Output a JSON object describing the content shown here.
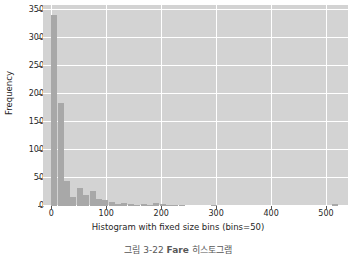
{
  "chart_data": {
    "type": "bar",
    "title": "",
    "subtitle": "",
    "xlabel": "Histogram with fixed size bins (bins=50)",
    "ylabel": "Frequency",
    "xlim": [
      -15,
      540
    ],
    "ylim": [
      0,
      358
    ],
    "grid": true,
    "legend": null,
    "bin_width": 11.6,
    "bins": 50,
    "xticks": [
      0,
      100,
      200,
      300,
      400,
      500
    ],
    "yticks": [
      0,
      50,
      100,
      150,
      200,
      250,
      300,
      350
    ],
    "bar_color": "#a8a8a8",
    "plot_background": "#d3d3d3",
    "grid_color": "#ffffff",
    "text_color": "#262626",
    "bin_edges": [
      0,
      11.6,
      23.2,
      34.8,
      46.4,
      58,
      69.6,
      81.2,
      92.8,
      104.4,
      116,
      127.6,
      139.2,
      150.8,
      162.4,
      174,
      185.6,
      197.2,
      208.8,
      220.4,
      232,
      243.6,
      255.2,
      266.8,
      278.4,
      290,
      301.6,
      313.2,
      324.8,
      336.4,
      348,
      359.6,
      371.2,
      382.8,
      394.4,
      406,
      417.6,
      429.2,
      440.8,
      452.4,
      464,
      475.6,
      487.2,
      498.8,
      510.4,
      522,
      533.6,
      545.2,
      556.8,
      568.4,
      580
    ],
    "values": [
      340,
      183,
      45,
      17,
      33,
      19,
      27,
      13,
      11,
      7,
      4,
      6,
      3,
      2,
      3,
      2,
      5,
      4,
      2,
      1,
      1,
      0,
      0,
      0,
      0,
      1,
      0,
      0,
      0,
      0,
      0,
      0,
      0,
      0,
      0,
      0,
      0,
      0,
      0,
      0,
      0,
      0,
      0,
      0,
      3,
      0,
      0,
      0,
      0,
      0
    ]
  },
  "figure": {
    "caption_prefix": "그림 3-22 ",
    "caption_bold": "Fare",
    "caption_suffix": " 히스토그램"
  }
}
